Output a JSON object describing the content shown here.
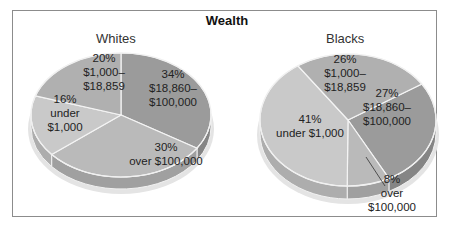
{
  "chart_data": [
    {
      "type": "pie",
      "title": "Wealth",
      "subtitle": "Whites",
      "categories": [
        "$18,860–$100,000",
        "over $100,000",
        "under $1,000",
        "$1,000–$18,859"
      ],
      "values": [
        34,
        30,
        16,
        20
      ],
      "labels": [
        [
          "34%",
          "$18,860–",
          "$100,000"
        ],
        [
          "30%",
          "over $100,000"
        ],
        [
          "16%",
          "under",
          "$1,000"
        ],
        [
          "20%",
          "$1,000–",
          "$18,859"
        ]
      ],
      "colors": [
        "#9b9b9b",
        "#bababa",
        "#c9c9c9",
        "#b0b0b0"
      ],
      "style": "3d"
    },
    {
      "type": "pie",
      "title": "Wealth",
      "subtitle": "Blacks",
      "categories": [
        "$18,860–$100,000",
        "over $100,000",
        "under $1,000",
        "$1,000–$18,859"
      ],
      "values": [
        27,
        8,
        41,
        26
      ],
      "labels": [
        [
          "27%",
          "$18,860–",
          "$100,000"
        ],
        [
          "8%",
          "over",
          "$100,000"
        ],
        [
          "41%",
          "under $1,000"
        ],
        [
          "26%",
          "$1,000–",
          "$18,859"
        ]
      ],
      "colors": [
        "#9b9b9b",
        "#bababa",
        "#c9c9c9",
        "#b0b0b0"
      ],
      "style": "3d"
    }
  ],
  "header": {
    "title": "Wealth"
  },
  "whites": {
    "subtitle": "Whites"
  },
  "blacks": {
    "subtitle": "Blacks"
  }
}
